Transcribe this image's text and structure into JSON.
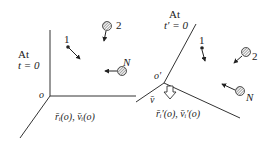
{
  "left_frame": {
    "title_line1": "At",
    "title_line2": "t = 0",
    "origin_label": "o",
    "state_label": "r̄ᵢ(o), v̄ᵢ(o)",
    "particles": [
      {
        "label": "1",
        "type": "point"
      },
      {
        "label": "2",
        "type": "hatched-sphere"
      },
      {
        "label": "N",
        "type": "hatched-sphere"
      }
    ]
  },
  "right_frame": {
    "title_line1": "At",
    "title_line2": "t′ = 0",
    "origin_label": "o′",
    "velocity_label": "v̄",
    "state_label": "r̄ᵢ′(o), v̄ᵢ′(o)",
    "particles": [
      {
        "label": "1",
        "type": "point"
      },
      {
        "label": "2",
        "type": "hatched-sphere"
      },
      {
        "label": "N",
        "type": "hatched-sphere"
      }
    ]
  },
  "colors": {
    "line": "#333333",
    "background": "#ffffff"
  }
}
